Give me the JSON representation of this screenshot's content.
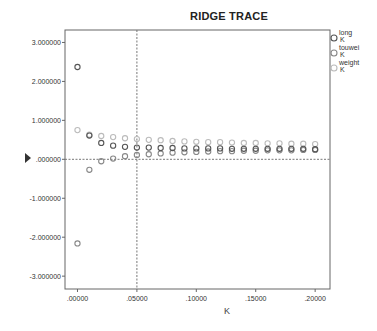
{
  "chart_data": {
    "type": "scatter",
    "title": "RIDGE TRACE",
    "xlabel": "K",
    "ylabel": "",
    "xlim": [
      -0.0105,
      0.2125
    ],
    "ylim": [
      -3.33,
      3.32
    ],
    "x_ticks": [
      ".00000",
      ".05000",
      ".10000",
      ".15000",
      ".20000"
    ],
    "x_tick_values": [
      0.0,
      0.05,
      0.1,
      0.15,
      0.2
    ],
    "y_ticks": [
      "3.000000",
      "2.000000",
      "1.000000",
      ".000000",
      "-1.000000",
      "-2.000000",
      "-3.000000"
    ],
    "y_tick_values": [
      3,
      2,
      1,
      0,
      -1,
      -2,
      -3
    ],
    "reference_lines": {
      "x": 0.05,
      "y": 0.0
    },
    "grid": false,
    "legend_position": "right",
    "x": [
      0.0,
      0.01,
      0.02,
      0.03,
      0.04,
      0.05,
      0.06,
      0.07,
      0.08,
      0.09,
      0.1,
      0.11,
      0.12,
      0.13,
      0.14,
      0.15,
      0.16,
      0.17,
      0.18,
      0.19,
      0.2
    ],
    "series": [
      {
        "name": "long K",
        "color": "#555555",
        "values": [
          2.37,
          0.61,
          0.42,
          0.35,
          0.32,
          0.3,
          0.3,
          0.29,
          0.29,
          0.28,
          0.28,
          0.28,
          0.28,
          0.27,
          0.27,
          0.27,
          0.27,
          0.27,
          0.27,
          0.27,
          0.26
        ]
      },
      {
        "name": "touwei K",
        "color": "#888888",
        "values": [
          -2.16,
          -0.27,
          -0.05,
          0.02,
          0.08,
          0.11,
          0.13,
          0.15,
          0.17,
          0.18,
          0.19,
          0.2,
          0.21,
          0.21,
          0.22,
          0.22,
          0.23,
          0.23,
          0.23,
          0.24,
          0.24
        ]
      },
      {
        "name": "weight K",
        "color": "#bbbbbb",
        "values": [
          0.75,
          0.63,
          0.6,
          0.57,
          0.54,
          0.52,
          0.5,
          0.49,
          0.47,
          0.46,
          0.45,
          0.44,
          0.44,
          0.43,
          0.42,
          0.42,
          0.41,
          0.41,
          0.4,
          0.4,
          0.39
        ]
      }
    ]
  },
  "legend": [
    {
      "line1": "long",
      "line2": "K"
    },
    {
      "line1": "touwei",
      "line2": "K"
    },
    {
      "line1": "weight",
      "line2": "K"
    }
  ]
}
